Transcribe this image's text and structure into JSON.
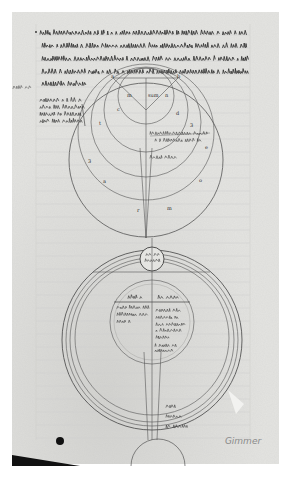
{
  "document": {
    "type": "manuscript-folio-photograph",
    "palette": {
      "background": "#ffffff",
      "parchment": "#e4e4e1",
      "parchment_dark": "#d2d2cf",
      "ink": "#2a2a2a",
      "ink_light": "#555555",
      "pencil": "#8a8a8a",
      "shadow": "#111111"
    }
  },
  "folio": {
    "x": 12,
    "y": 12,
    "width": 267,
    "height": 452
  },
  "text_block": {
    "lines": [
      {
        "y": 34,
        "x1": 40,
        "x2": 247
      },
      {
        "y": 47,
        "x1": 42,
        "x2": 247
      },
      {
        "y": 60,
        "x1": 42,
        "x2": 247
      },
      {
        "y": 73,
        "x1": 42,
        "x2": 247
      },
      {
        "y": 85,
        "x1": 42,
        "x2": 88
      }
    ],
    "paragraph_mark_x": 36
  },
  "margin_notes": {
    "left_mark": {
      "x": 13,
      "y": 88,
      "width": 16
    },
    "gloss_lines": [
      {
        "y": 101,
        "x1": 40,
        "x2": 82
      },
      {
        "y": 108,
        "x1": 40,
        "x2": 84
      },
      {
        "y": 115,
        "x1": 40,
        "x2": 80
      },
      {
        "y": 122,
        "x1": 40,
        "x2": 82
      }
    ]
  },
  "upper_diagram": {
    "triangle": {
      "points": "113,78 178,78 146,110"
    },
    "triangle_labels": [
      {
        "text": "a",
        "x": 111,
        "y": 78
      },
      {
        "text": "b",
        "x": 177,
        "y": 78
      }
    ],
    "circles": [
      {
        "cx": 146,
        "cy": 96,
        "r": 28
      },
      {
        "cx": 146,
        "cy": 110,
        "r": 42
      },
      {
        "cx": 146,
        "cy": 122,
        "r": 55
      },
      {
        "cx": 146,
        "cy": 132,
        "r": 68
      },
      {
        "cx": 146,
        "cy": 160,
        "r": 77
      }
    ],
    "inner_labels": [
      {
        "text": "m",
        "x": 127,
        "y": 97
      },
      {
        "text": "sum",
        "x": 148,
        "y": 97
      },
      {
        "text": "n",
        "x": 165,
        "y": 97
      },
      {
        "text": "c",
        "x": 117,
        "y": 111
      },
      {
        "text": "d",
        "x": 176,
        "y": 115
      },
      {
        "text": "3",
        "x": 190,
        "y": 127
      },
      {
        "text": "t",
        "x": 99,
        "y": 125
      },
      {
        "text": "3",
        "x": 88,
        "y": 163
      },
      {
        "text": "e",
        "x": 205,
        "y": 149
      },
      {
        "text": "a",
        "x": 103,
        "y": 183
      },
      {
        "text": "o",
        "x": 199,
        "y": 182
      },
      {
        "text": "r",
        "x": 137,
        "y": 212
      },
      {
        "text": "m",
        "x": 167,
        "y": 210
      }
    ],
    "text_labels": [
      {
        "x1": 150,
        "x2": 210,
        "y": 134
      },
      {
        "x1": 155,
        "x2": 202,
        "y": 141
      },
      {
        "x1": 150,
        "x2": 176,
        "y": 158
      }
    ]
  },
  "lower_diagram": {
    "top_small_circle": {
      "cx": 152,
      "cy": 259,
      "r": 12
    },
    "top_small_circle_text": [
      {
        "x1": 146,
        "x2": 158,
        "y": 255
      },
      {
        "x1": 145,
        "x2": 159,
        "y": 261
      }
    ],
    "horizontal_line": {
      "x1": 93,
      "y": 272,
      "x2": 210
    },
    "outer_arcs": [
      {
        "cx": 152,
        "cy": 340,
        "r": 90
      },
      {
        "cx": 152,
        "cy": 340,
        "r": 86
      },
      {
        "cx": 152,
        "cy": 340,
        "r": 82
      },
      {
        "cx": 152,
        "cy": 338,
        "r": 77
      }
    ],
    "inner_circle": {
      "cx": 152,
      "cy": 322,
      "r": 42
    },
    "inner_circle_ring": {
      "cx": 152,
      "cy": 322,
      "r": 38
    },
    "header_line": {
      "x1": 114,
      "y": 302,
      "x2": 190
    },
    "header_text": [
      {
        "x1": 128,
        "x2": 143,
        "y": 298
      },
      {
        "x1": 158,
        "x2": 178,
        "y": 298
      }
    ],
    "left_text_lines": [
      {
        "x1": 117,
        "x2": 149,
        "y": 308
      },
      {
        "x1": 117,
        "x2": 147,
        "y": 315
      },
      {
        "x1": 117,
        "x2": 131,
        "y": 322
      }
    ],
    "right_text_lines": [
      {
        "x1": 156,
        "x2": 181,
        "y": 311
      },
      {
        "x1": 156,
        "x2": 178,
        "y": 318
      },
      {
        "x1": 156,
        "x2": 186,
        "y": 325
      },
      {
        "x1": 156,
        "x2": 180,
        "y": 331
      },
      {
        "x1": 156,
        "x2": 168,
        "y": 338
      },
      {
        "x1": 155,
        "x2": 176,
        "y": 346
      },
      {
        "x1": 155,
        "x2": 172,
        "y": 351
      }
    ],
    "band_labels": [
      {
        "x1": 166,
        "x2": 176,
        "y": 407
      },
      {
        "x1": 166,
        "x2": 180,
        "y": 417
      },
      {
        "x1": 166,
        "x2": 188,
        "y": 427
      }
    ],
    "base_arc": {
      "cx": 158,
      "cy": 470,
      "r": 27
    }
  },
  "axis_lines": [
    {
      "x1": 146,
      "y1": 78,
      "x2": 146,
      "y2": 238
    },
    {
      "x1": 140,
      "y1": 148,
      "x2": 146,
      "y2": 238
    },
    {
      "x1": 152,
      "y1": 148,
      "x2": 146,
      "y2": 238
    },
    {
      "x1": 152,
      "y1": 238,
      "x2": 152,
      "y2": 440
    },
    {
      "x1": 144,
      "y1": 352,
      "x2": 148,
      "y2": 440
    },
    {
      "x1": 161,
      "y1": 352,
      "x2": 157,
      "y2": 440
    }
  ],
  "annotations": {
    "pencil_note": {
      "text": "Gimmer",
      "x": 243,
      "y": 444
    },
    "ink_dot": {
      "cx": 60,
      "cy": 441,
      "r": 4
    }
  }
}
